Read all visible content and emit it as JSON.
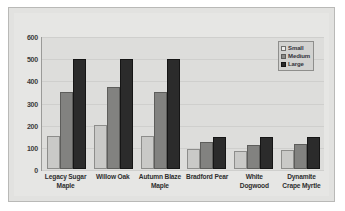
{
  "chart_data": {
    "type": "bar",
    "title": "",
    "xlabel": "",
    "ylabel": "",
    "categories": [
      "Legacy Sugar Maple",
      "Willow Oak",
      "Autumn Blaze Maple",
      "Bradford Pear",
      "White Dogwood",
      "Dynamite Crape Myrtle"
    ],
    "series": [
      {
        "name": "Small",
        "color": "#c9c9c7",
        "values": [
          150,
          200,
          150,
          90,
          80,
          85
        ]
      },
      {
        "name": "Medium",
        "color": "#828280",
        "values": [
          350,
          375,
          350,
          125,
          110,
          115
        ]
      },
      {
        "name": "Large",
        "color": "#2b2b2b",
        "values": [
          500,
          500,
          500,
          145,
          145,
          145
        ]
      }
    ],
    "ylim": [
      0,
      600
    ],
    "yticks": [
      0,
      100,
      200,
      300,
      400,
      500,
      600
    ],
    "ytick_labels": [
      "0",
      "100",
      "200",
      "300",
      "400",
      "500",
      "600"
    ],
    "grid": true,
    "legend_position": "top-right"
  },
  "legend": {
    "items": [
      {
        "label": "Small"
      },
      {
        "label": "Medium"
      },
      {
        "label": "Large"
      }
    ]
  }
}
